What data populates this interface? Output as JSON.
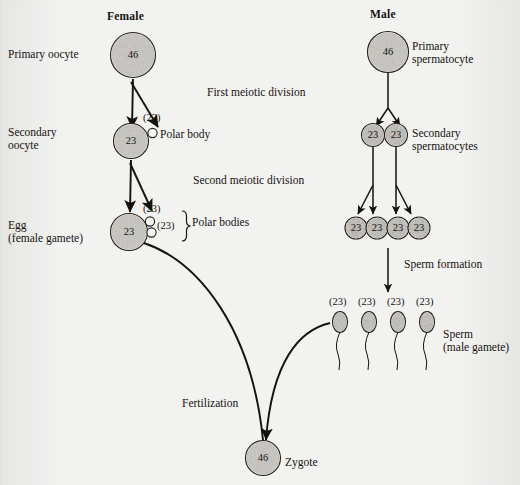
{
  "diagram": {
    "columns": {
      "female_heading": "Female",
      "male_heading": "Male"
    },
    "stage_labels": {
      "primary_oocyte": "Primary oocyte",
      "secondary_oocyte": "Secondary\noocyte",
      "egg": "Egg\n(female gamete)",
      "primary_spermatocyte": "Primary\nspermatocyte",
      "secondary_spermatocytes": "Secondary\nspermatocytes",
      "sperm": "Sperm\n(male gamete)",
      "zygote": "Zygote",
      "polar_body": "Polar body",
      "polar_bodies": "Polar bodies"
    },
    "process_labels": {
      "first_meiotic_division": "First meiotic division",
      "second_meiotic_division": "Second meiotic division",
      "sperm_formation": "Sperm formation",
      "fertilization": "Fertilization"
    },
    "cells": {
      "primary_oocyte_count": "46",
      "secondary_oocyte_count": "23",
      "egg_count": "23",
      "first_polar_body_count": "(23)",
      "second_polar_body_count": "(23)",
      "primary_spermatocyte_count": "46",
      "secondary_spermatocyte_counts": [
        "23",
        "23"
      ],
      "spermatid_counts": [
        "23",
        "23",
        "23",
        "23"
      ],
      "sperm_counts": [
        "(23)",
        "(23)",
        "(23)",
        "(23)"
      ],
      "zygote_count": "46"
    },
    "colors": {
      "background": "#f2f2f1",
      "ink": "#16120f",
      "cell_fill": "#dcdad6",
      "outline": "#23201c"
    }
  }
}
